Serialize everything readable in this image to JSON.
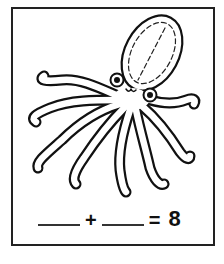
{
  "worksheet": {
    "illustration": "octopus",
    "equation": {
      "blank1": "",
      "plus": "+",
      "blank2": "",
      "equals": "=",
      "total": "8"
    }
  },
  "colors": {
    "ink": "#111111",
    "paper": "#ffffff"
  }
}
